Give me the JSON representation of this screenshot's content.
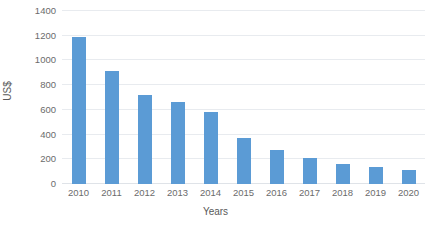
{
  "chart_data": {
    "type": "bar",
    "title": "",
    "subtitle": "",
    "xlabel": "Years",
    "ylabel": "US$",
    "categories": [
      "2010",
      "2011",
      "2012",
      "2013",
      "2014",
      "2015",
      "2016",
      "2017",
      "2018",
      "2019",
      "2020"
    ],
    "values": [
      1190,
      915,
      720,
      665,
      585,
      370,
      275,
      210,
      160,
      140,
      115
    ],
    "series": [
      {
        "name": "US$",
        "values": [
          1190,
          915,
          720,
          665,
          585,
          370,
          275,
          210,
          160,
          140,
          115
        ]
      }
    ],
    "ylim": [
      0,
      1400
    ],
    "ytick_values": [
      0,
      200,
      400,
      600,
      800,
      1000,
      1200,
      1400
    ],
    "ytick_labels": [
      "0",
      "200",
      "400",
      "600",
      "800",
      "1000",
      "1200",
      "1400"
    ],
    "grid": true,
    "grid_axis": "y",
    "legend": false,
    "legend_position": "none",
    "bar_color": "#5b9bd5",
    "gridline_color": "#e8ebef",
    "tick_label_color": "#6b6b6b",
    "axis_title_color": "#595959",
    "background_color": "#ffffff"
  }
}
